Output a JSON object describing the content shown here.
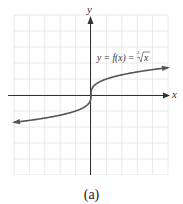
{
  "chart_data": {
    "type": "line",
    "title": "",
    "function_label": "y = f(x) = ∛x",
    "xlabel": "x",
    "ylabel": "y",
    "xlim": [
      -5,
      5
    ],
    "ylim": [
      -5,
      5
    ],
    "grid": true,
    "grid_step": 1,
    "series": [
      {
        "name": "y = ∛x",
        "x": [
          -5,
          -4,
          -3,
          -2,
          -1,
          -0.5,
          -0.125,
          0,
          0.125,
          0.5,
          1,
          2,
          3,
          4,
          5
        ],
        "y": [
          -1.71,
          -1.59,
          -1.44,
          -1.26,
          -1,
          -0.79,
          -0.5,
          0,
          0.5,
          0.79,
          1,
          1.26,
          1.44,
          1.59,
          1.71
        ]
      }
    ],
    "colors": {
      "curve": "#555555",
      "axes": "#333333",
      "grid": "#dddddd"
    }
  },
  "labels": {
    "x_axis": "x",
    "y_axis": "y",
    "function_prefix": "y = f(x) = ",
    "radical_index": "3",
    "radicand": "x",
    "caption": "(a)"
  }
}
